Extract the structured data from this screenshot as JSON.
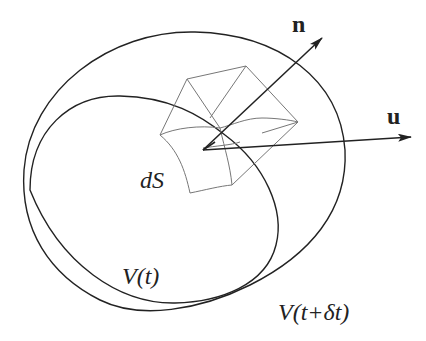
{
  "diagram": {
    "labels": {
      "normal_vector": "n",
      "velocity_vector": "u",
      "surface_element": "dS",
      "volume_t": "V(t)",
      "volume_t_dt": "V(t+δt)"
    },
    "colors": {
      "stroke": "#222222",
      "box_stroke": "#777777",
      "background": "#ffffff"
    },
    "elements": [
      {
        "id": "outer-boundary",
        "represents": "V(t+δt)"
      },
      {
        "id": "inner-boundary",
        "represents": "V(t)"
      },
      {
        "id": "surface-element-box",
        "represents": "dS"
      },
      {
        "id": "normal-arrow",
        "represents": "n"
      },
      {
        "id": "velocity-arrow",
        "represents": "u"
      }
    ]
  }
}
